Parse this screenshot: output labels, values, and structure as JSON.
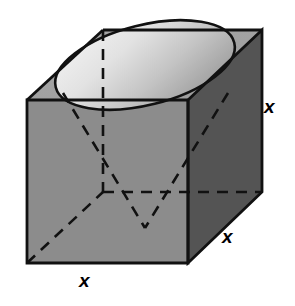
{
  "figure": {
    "background_color": "#ffffff"
  },
  "labels": {
    "height": "x",
    "depth": "x",
    "width": "x"
  },
  "colors": {
    "front_face": "#8c8c8c",
    "right_face": "#545454",
    "top_face": "#a2a2a2",
    "ellipse_light": "#ededed",
    "ellipse_mid": "#bdbdbd",
    "ellipse_dark": "#8f8f8f",
    "outline": "#111111",
    "hidden_line": "#111111",
    "background": "#ffffff"
  },
  "geometry": {
    "front_top_left": [
      27,
      100
    ],
    "front_top_right": [
      188,
      100
    ],
    "front_bottom_left": [
      27,
      263
    ],
    "front_bottom_right": [
      188,
      263
    ],
    "back_top_left": [
      103,
      30
    ],
    "back_top_right": [
      262,
      30
    ],
    "back_bottom_right": [
      262,
      192
    ],
    "center_bottom_face": [
      145,
      228
    ],
    "ellipse_center": [
      145,
      65
    ],
    "ellipse_rx": 92,
    "ellipse_ry": 40,
    "ellipse_rotation_deg": -14
  },
  "shapes": {
    "cube_label": "cube",
    "cone_label": "inscribed cone",
    "ellipse_label": "cone base ellipse",
    "apex_label": "cone apex"
  }
}
